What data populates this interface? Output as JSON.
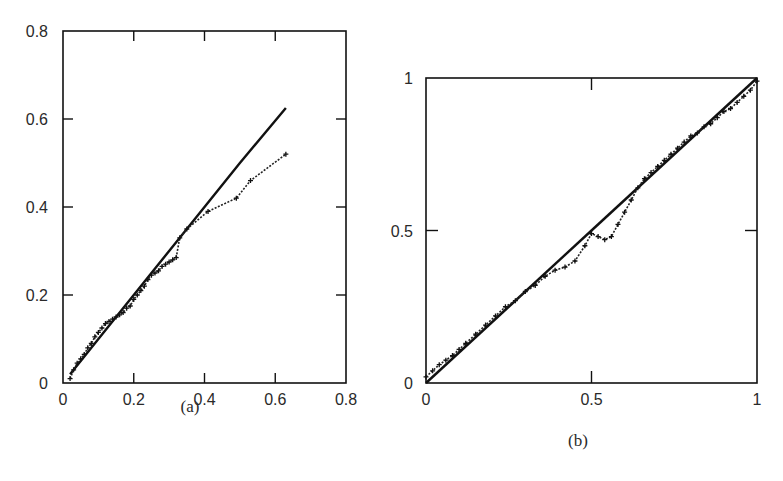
{
  "chart_data": [
    {
      "id": "a",
      "type": "scatter",
      "caption": "(a)",
      "title": "",
      "xlabel": "",
      "ylabel": "",
      "xlim": [
        0,
        0.8
      ],
      "ylim": [
        0,
        0.8
      ],
      "grid": false,
      "legend": null,
      "xticks": [
        0,
        0.2,
        0.4,
        0.6,
        0.8
      ],
      "xtick_labels": [
        "0",
        "0.2",
        "0.4",
        "0.6",
        "0.8"
      ],
      "yticks": [
        0,
        0.2,
        0.4,
        0.6,
        0.8
      ],
      "ytick_labels": [
        "0",
        "0.2",
        "0.4",
        "0.6",
        "0.8"
      ],
      "series": [
        {
          "name": "reference line",
          "style": "solid-line",
          "x": [
            0.02,
            0.1,
            0.2,
            0.3,
            0.4,
            0.5,
            0.63
          ],
          "y": [
            0.02,
            0.1,
            0.2,
            0.3,
            0.4,
            0.5,
            0.625
          ]
        },
        {
          "name": "empirical points",
          "style": "plus-markers",
          "x": [
            0.02,
            0.03,
            0.04,
            0.05,
            0.06,
            0.07,
            0.08,
            0.09,
            0.1,
            0.11,
            0.12,
            0.13,
            0.14,
            0.15,
            0.16,
            0.17,
            0.18,
            0.19,
            0.2,
            0.21,
            0.22,
            0.23,
            0.24,
            0.25,
            0.26,
            0.27,
            0.28,
            0.29,
            0.3,
            0.31,
            0.32,
            0.33,
            0.35,
            0.41,
            0.49,
            0.53,
            0.63
          ],
          "y": [
            0.01,
            0.03,
            0.045,
            0.055,
            0.065,
            0.08,
            0.09,
            0.105,
            0.115,
            0.125,
            0.135,
            0.14,
            0.145,
            0.15,
            0.155,
            0.16,
            0.17,
            0.175,
            0.19,
            0.2,
            0.21,
            0.22,
            0.235,
            0.245,
            0.25,
            0.255,
            0.265,
            0.27,
            0.275,
            0.28,
            0.285,
            0.33,
            0.35,
            0.39,
            0.42,
            0.46,
            0.52
          ]
        }
      ]
    },
    {
      "id": "b",
      "type": "scatter",
      "caption": "(b)",
      "title": "",
      "xlabel": "",
      "ylabel": "",
      "xlim": [
        0,
        1
      ],
      "ylim": [
        0,
        1
      ],
      "grid": false,
      "legend": null,
      "xticks": [
        0,
        0.5,
        1
      ],
      "xtick_labels": [
        "0",
        "0.5",
        "1"
      ],
      "yticks": [
        0,
        0.5,
        1
      ],
      "ytick_labels": [
        "0",
        "0.5",
        "1"
      ],
      "series": [
        {
          "name": "reference line",
          "style": "solid-line",
          "x": [
            0,
            0.25,
            0.5,
            0.75,
            1.0
          ],
          "y": [
            0,
            0.25,
            0.5,
            0.75,
            1.0
          ]
        },
        {
          "name": "empirical points",
          "style": "plus-markers",
          "x": [
            0.0,
            0.02,
            0.04,
            0.06,
            0.08,
            0.1,
            0.12,
            0.15,
            0.18,
            0.21,
            0.24,
            0.27,
            0.3,
            0.33,
            0.36,
            0.39,
            0.42,
            0.45,
            0.48,
            0.5,
            0.52,
            0.54,
            0.56,
            0.58,
            0.6,
            0.62,
            0.64,
            0.66,
            0.68,
            0.7,
            0.72,
            0.74,
            0.76,
            0.78,
            0.8,
            0.82,
            0.84,
            0.86,
            0.88,
            0.9,
            0.92,
            0.94,
            0.96,
            0.98,
            1.0
          ],
          "y": [
            0.02,
            0.04,
            0.06,
            0.075,
            0.09,
            0.11,
            0.13,
            0.16,
            0.19,
            0.22,
            0.25,
            0.27,
            0.3,
            0.32,
            0.35,
            0.37,
            0.38,
            0.4,
            0.45,
            0.49,
            0.48,
            0.47,
            0.48,
            0.52,
            0.56,
            0.6,
            0.64,
            0.67,
            0.69,
            0.71,
            0.73,
            0.75,
            0.77,
            0.79,
            0.81,
            0.82,
            0.84,
            0.85,
            0.87,
            0.89,
            0.9,
            0.92,
            0.94,
            0.96,
            0.99
          ]
        }
      ]
    }
  ],
  "captions": {
    "a": "(a)",
    "b": "(b)"
  }
}
